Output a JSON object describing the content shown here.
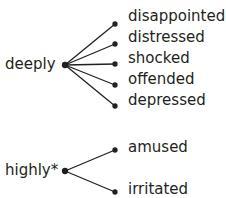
{
  "groups": [
    {
      "head": "deeply",
      "items": [
        "disappointed",
        "distressed",
        "shocked",
        "offended",
        "depressed"
      ]
    },
    {
      "head": "highly*",
      "items": [
        "amused",
        "irritated"
      ]
    }
  ]
}
